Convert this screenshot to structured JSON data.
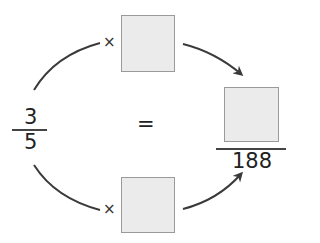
{
  "diagram": {
    "left_fraction": {
      "numerator": "3",
      "denominator": "5"
    },
    "equals_sign": "=",
    "right_fraction": {
      "numerator": "",
      "denominator": "188"
    },
    "top_multiplier": {
      "operator": "×",
      "value": ""
    },
    "bottom_multiplier": {
      "operator": "×",
      "value": ""
    }
  },
  "colors": {
    "box_fill": "#ebebeb",
    "box_border": "#9a9a9a",
    "arrow": "#3a3a3a"
  }
}
